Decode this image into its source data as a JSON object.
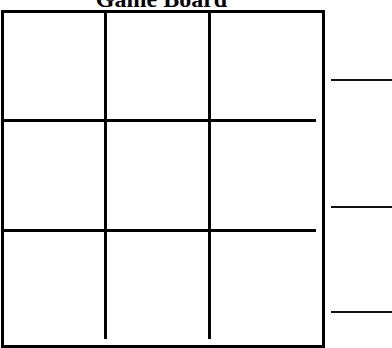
{
  "title": "Game Board",
  "board": {
    "rows": 3,
    "cols": 3,
    "cells": [
      [
        "",
        "",
        ""
      ],
      [
        "",
        "",
        ""
      ],
      [
        "",
        "",
        ""
      ]
    ]
  },
  "side_lines": [
    {
      "row": 1,
      "value": ""
    },
    {
      "row": 2,
      "value": ""
    },
    {
      "row": 3,
      "value": ""
    }
  ],
  "colors": {
    "line": "#000000",
    "background": "#ffffff"
  }
}
